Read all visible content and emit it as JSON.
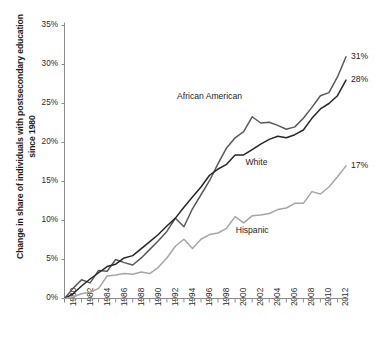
{
  "chart_data": {
    "type": "line",
    "title": "",
    "xlabel": "",
    "ylabel": "Change in share of individuals with postsecondary education since 1980",
    "xlim": [
      1980,
      2013
    ],
    "ylim": [
      0,
      35
    ],
    "grid": false,
    "legend_position": "inline-annotations",
    "y_tick_labels": [
      "35%",
      "30%",
      "25%",
      "20%",
      "15%",
      "10%",
      "5%",
      "0%"
    ],
    "y_ticks": [
      35,
      30,
      25,
      20,
      15,
      10,
      5,
      0
    ],
    "x_tick_labels": [
      "1980",
      "1982",
      "1984",
      "1986",
      "1988",
      "1990",
      "1992",
      "1994",
      "1996",
      "1998",
      "2000",
      "2002",
      "2004",
      "2006",
      "2008",
      "2010",
      "2012"
    ],
    "x_ticks": [
      1980,
      1982,
      1984,
      1986,
      1988,
      1990,
      1992,
      1994,
      1996,
      1998,
      2000,
      2002,
      2004,
      2006,
      2008,
      2010,
      2012
    ],
    "x": [
      1980,
      1981,
      1982,
      1983,
      1984,
      1985,
      1986,
      1987,
      1988,
      1989,
      1990,
      1991,
      1992,
      1993,
      1994,
      1995,
      1996,
      1997,
      1998,
      1999,
      2000,
      2001,
      2002,
      2003,
      2004,
      2005,
      2006,
      2007,
      2008,
      2009,
      2010,
      2011,
      2012,
      2013
    ],
    "series": [
      {
        "name": "African American",
        "color": "#595959",
        "end_label": "31%",
        "values": [
          0.0,
          1.3,
          2.4,
          2.0,
          3.6,
          3.5,
          5.0,
          4.6,
          4.3,
          5.2,
          6.3,
          7.4,
          8.6,
          10.3,
          9.2,
          11.5,
          13.3,
          15.1,
          17.3,
          19.3,
          20.6,
          21.4,
          23.3,
          22.5,
          22.6,
          22.2,
          21.7,
          22.0,
          23.1,
          24.5,
          26.0,
          26.4,
          28.4,
          31.0
        ]
      },
      {
        "name": "White",
        "color": "#262626",
        "end_label": "28%",
        "values": [
          0.0,
          0.6,
          1.6,
          2.5,
          3.3,
          4.1,
          4.4,
          5.2,
          5.5,
          6.4,
          7.3,
          8.2,
          9.3,
          10.3,
          11.7,
          13.0,
          14.3,
          15.8,
          16.6,
          17.2,
          18.4,
          18.4,
          19.1,
          19.8,
          20.4,
          20.8,
          20.6,
          21.0,
          21.6,
          23.1,
          24.3,
          25.0,
          26.0,
          28.0
        ]
      },
      {
        "name": "Hispanic",
        "color": "#a6a6a6",
        "end_label": "17%",
        "values": [
          0.0,
          0.2,
          0.6,
          0.8,
          1.3,
          2.9,
          3.0,
          3.2,
          3.1,
          3.4,
          3.2,
          4.0,
          5.2,
          6.7,
          7.6,
          6.4,
          7.6,
          8.2,
          8.4,
          9.0,
          10.5,
          9.7,
          10.6,
          10.7,
          10.9,
          11.4,
          11.6,
          12.2,
          12.2,
          13.7,
          13.4,
          14.3,
          15.6,
          17.0
        ]
      }
    ],
    "annotations": [
      {
        "text": "African American",
        "x": 1997,
        "y": 25.8
      },
      {
        "text": "White",
        "x": 2002.5,
        "y": 17.4
      },
      {
        "text": "Hispanic",
        "x": 2002,
        "y": 8.6
      }
    ]
  }
}
